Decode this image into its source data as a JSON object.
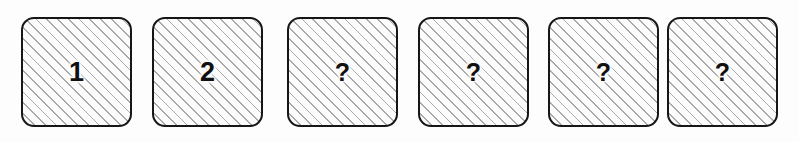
{
  "diagram": {
    "kind": "sequence-tiles",
    "tile_count": 6,
    "colors": {
      "page_background": "#fdfdfd",
      "tile_fill": "#fcfcfc",
      "tile_border": "#161616",
      "hatch_line": "#a9a9a9",
      "label_text": "#101010"
    },
    "tiles": [
      {
        "label": "1",
        "kind": "known",
        "name": "tile-1"
      },
      {
        "label": "2",
        "kind": "known",
        "name": "tile-2"
      },
      {
        "label": "?",
        "kind": "unknown",
        "name": "tile-3"
      },
      {
        "label": "?",
        "kind": "unknown",
        "name": "tile-4"
      },
      {
        "label": "?",
        "kind": "unknown",
        "name": "tile-5"
      },
      {
        "label": "?",
        "kind": "unknown",
        "name": "tile-6"
      }
    ]
  }
}
